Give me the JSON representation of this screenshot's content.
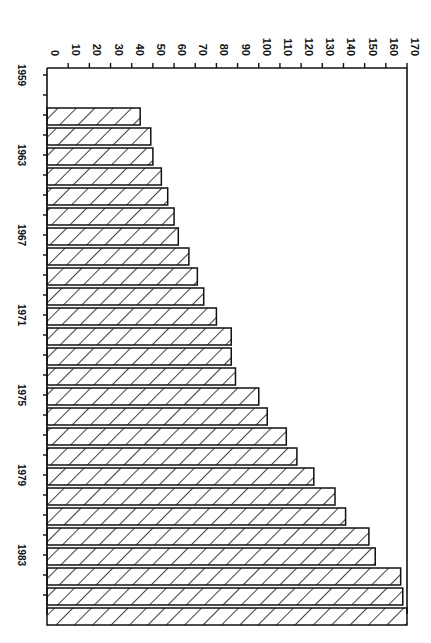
{
  "chart_data": {
    "type": "bar",
    "orientation": "horizontal (page rotated 90°)",
    "title": "",
    "xlabel": "",
    "ylabel": "",
    "value_axis": {
      "range": [
        0,
        170
      ],
      "ticks": [
        0,
        10,
        20,
        30,
        40,
        50,
        60,
        70,
        80,
        90,
        100,
        110,
        120,
        130,
        140,
        150,
        160,
        170
      ]
    },
    "category_axis": {
      "labeled_ticks": [
        "1959",
        "1963",
        "1967",
        "1971",
        "1975",
        "1979",
        "1983"
      ]
    },
    "categories": [
      "1961",
      "1962",
      "1963",
      "1964",
      "1965",
      "1966",
      "1967",
      "1968",
      "1969",
      "1970",
      "1971",
      "1972",
      "1973",
      "1974",
      "1975",
      "1976",
      "1977",
      "1978",
      "1979",
      "1980",
      "1981",
      "1982",
      "1983",
      "1984",
      "1985",
      "1986"
    ],
    "values": [
      44,
      49,
      50,
      54,
      57,
      60,
      62,
      67,
      71,
      74,
      80,
      87,
      87,
      89,
      100,
      104,
      113,
      118,
      126,
      136,
      141,
      152,
      155,
      167,
      168,
      170
    ],
    "grid": false,
    "legend": null,
    "bar_fill": "diagonal hatch",
    "colors": {
      "ink": "#111111",
      "background": "#ffffff"
    }
  }
}
